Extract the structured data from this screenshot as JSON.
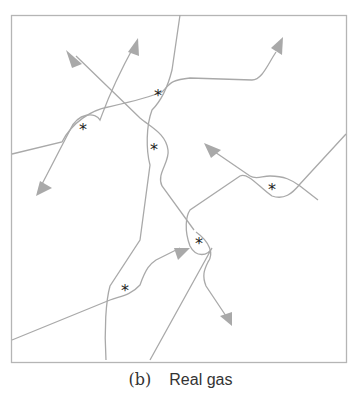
{
  "figure": {
    "caption": {
      "label": "(b)",
      "text": "Real gas"
    },
    "colors": {
      "line": "#a9a9a9",
      "arrow": "#a9a9a9",
      "frame": "#b5b5b5",
      "marker": "#222222"
    },
    "frame": {
      "x": 11,
      "y": 15,
      "width": 335,
      "height": 347
    },
    "collision_marker": "*",
    "collisions": [
      {
        "x": 83,
        "y": 128
      },
      {
        "x": 158,
        "y": 94
      },
      {
        "x": 154,
        "y": 148
      },
      {
        "x": 272,
        "y": 188
      },
      {
        "x": 199,
        "y": 242
      },
      {
        "x": 125,
        "y": 289
      }
    ]
  }
}
